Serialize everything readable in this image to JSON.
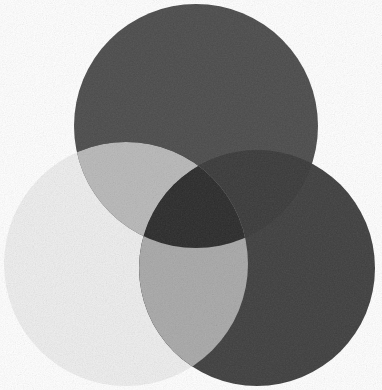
{
  "figure": {
    "type": "venn3",
    "background_color": "#ffffff",
    "width": 382,
    "height": 390,
    "texture": "grain"
  },
  "chart_data": {
    "type": "venn",
    "subtitle": "",
    "xlabel": "",
    "ylabel": "",
    "grid": false,
    "legend_position": "none",
    "sets": [
      {
        "id": "top",
        "name": "Top set",
        "label": "",
        "color": "#4c4c4c",
        "center_x": 196,
        "center_y": 126,
        "radius": 122
      },
      {
        "id": "left",
        "name": "Left set",
        "label": "",
        "color": "#eeeeee",
        "center_x": 126,
        "center_y": 264,
        "radius": 122
      },
      {
        "id": "right",
        "name": "Right set",
        "label": "",
        "color": "#3f3f3f",
        "center_x": 257,
        "center_y": 268,
        "radius": 118
      }
    ],
    "regions": [
      {
        "id": "top-only",
        "sets": [
          "top"
        ],
        "color": "#4c4c4c"
      },
      {
        "id": "left-only",
        "sets": [
          "left"
        ],
        "color": "#eeeeee"
      },
      {
        "id": "right-only",
        "sets": [
          "right"
        ],
        "color": "#3f3f3f"
      },
      {
        "id": "top-left",
        "sets": [
          "top",
          "left"
        ],
        "color": "#b9b9b9"
      },
      {
        "id": "left-right",
        "sets": [
          "left",
          "right"
        ],
        "color": "#a9a9a9"
      },
      {
        "id": "top-right",
        "sets": [
          "top",
          "right"
        ],
        "color": "#3a3a3a"
      },
      {
        "id": "top-left-right",
        "sets": [
          "top",
          "left",
          "right"
        ],
        "color": "#2b2b2b"
      }
    ]
  },
  "colors": {
    "background": "#ffffff",
    "top_circle": "#4c4c4c",
    "left_circle": "#eeeeee",
    "right_circle": "#3f3f3f",
    "top_left_overlap": "#b9b9b9",
    "left_right_overlap": "#a9a9a9",
    "top_right_overlap": "#3a3a3a",
    "center_overlap": "#2b2b2b"
  }
}
